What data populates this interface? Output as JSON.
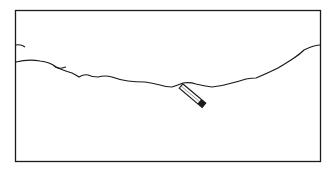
{
  "figure": {
    "colors": {
      "stroke": "#1a1a1a",
      "background": "#ffffff"
    },
    "elements": [
      {
        "name": "frame",
        "type": "rectangle"
      },
      {
        "name": "horizon-curve",
        "type": "freehand-line"
      },
      {
        "name": "left-stub",
        "type": "short-line"
      },
      {
        "name": "pencil",
        "type": "icon"
      }
    ]
  }
}
